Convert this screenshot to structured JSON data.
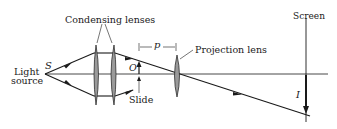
{
  "diagram": {
    "type": "optical-ray-diagram",
    "labels": {
      "condensing_lenses": "Condensing lenses",
      "light": "Light",
      "source": "source",
      "source_symbol": "S",
      "object_symbol": "O",
      "slide": "Slide",
      "distance_symbol": "p",
      "projection_lens": "Projection lens",
      "screen": "Screen",
      "image_symbol": "I"
    },
    "colors": {
      "line": "#1a1a1a",
      "lens_fill": "#9a9a9a",
      "background": "#ffffff"
    }
  }
}
